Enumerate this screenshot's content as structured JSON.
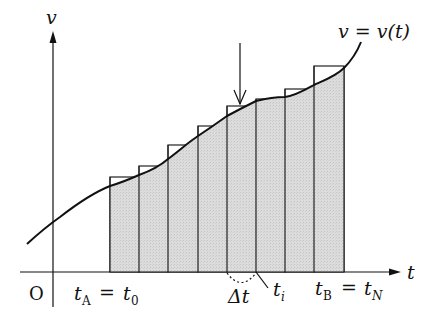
{
  "diagram": {
    "title": "",
    "axes": {
      "y_label": "v",
      "x_label": "t",
      "origin_label": "O"
    },
    "curve_label": "v = v(t)",
    "x_labels": {
      "start": "t_A = t_0",
      "start_main": "t",
      "start_sub": "A",
      "start_rhs_main": "t",
      "start_rhs_sub": "0",
      "end_main": "t",
      "end_sub": "B",
      "end_rhs_main": "t",
      "end_rhs_sub": "N",
      "ti_main": "t",
      "ti_sub": "i",
      "delta": "Δt"
    },
    "bars": {
      "count": 8,
      "x_edges": [
        110,
        139,
        168,
        198,
        227,
        256,
        285,
        314,
        344
      ],
      "tops": [
        177,
        166,
        145,
        126,
        106,
        99,
        89,
        66
      ],
      "fill_color": "#d6d6d6",
      "stroke_color": "#222222"
    },
    "annotations": {
      "arrow": "downward arrow pointing at bar 5",
      "dotted_arc": "marks width Δt of one bar",
      "ti_leader": "line from bar right edge to t_i label"
    }
  }
}
